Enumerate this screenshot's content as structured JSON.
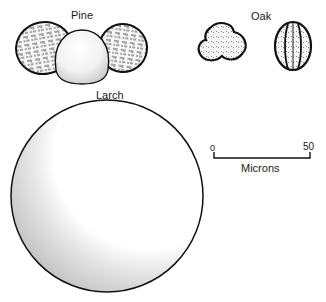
{
  "figure": {
    "labels": {
      "pine": "Pine",
      "oak": "Oak",
      "larch": "Larch"
    },
    "scale_bar": {
      "start": "0",
      "end": "50",
      "unit": "Microns"
    },
    "grains": [
      {
        "name": "pine",
        "icon": "pine-pollen-bisaccate"
      },
      {
        "name": "oak-polar",
        "icon": "oak-pollen-trilobed"
      },
      {
        "name": "oak-equatorial",
        "icon": "oak-pollen-tricolpate"
      },
      {
        "name": "larch",
        "icon": "larch-pollen-spherical"
      }
    ],
    "colors": {
      "outline": "#111111",
      "shading": "#bdbdbd",
      "background": "#ffffff"
    }
  }
}
